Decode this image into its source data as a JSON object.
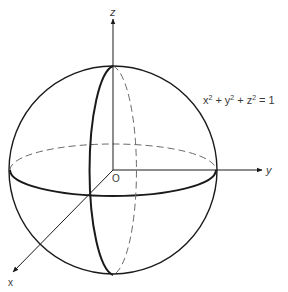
{
  "figure": {
    "type": "unit-sphere-diagram",
    "axes": {
      "x": {
        "label": "x"
      },
      "y": {
        "label": "y"
      },
      "z": {
        "label": "z"
      }
    },
    "origin_label": "O",
    "equation": {
      "base_x": "x",
      "base_y": "y",
      "base_z": "z",
      "exponent": "2",
      "plus": "+",
      "equals": "=",
      "rhs": "1"
    },
    "colors": {
      "stroke": "#1a1a1a",
      "dashed": "#6a6a6a",
      "text": "#3a3a3a",
      "background": "#ffffff"
    }
  }
}
